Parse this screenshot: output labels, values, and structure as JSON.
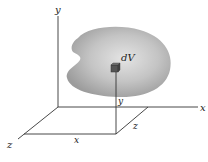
{
  "diagram": {
    "labels": {
      "y_axis": "y",
      "x_axis": "x",
      "z_axis": "z",
      "element": "dV",
      "y_coord": "y",
      "x_coord": "x",
      "z_coord": "z"
    },
    "colors": {
      "body_fill": "#a8a8a8",
      "body_highlight": "#e2e2e2",
      "element_fill": "#555555",
      "axis_stroke": "#333333"
    }
  }
}
